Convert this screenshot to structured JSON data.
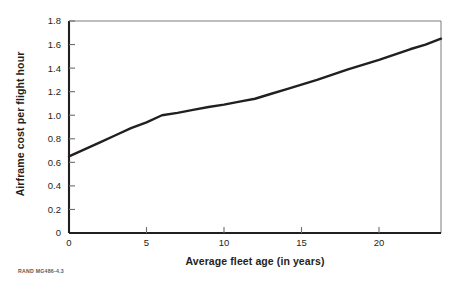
{
  "figure": {
    "source_note": "RAND MG486-4.3",
    "frame_color": "#6d6e71",
    "axis_color": "#231f20",
    "line_color": "#231f20",
    "background": "#ffffff"
  },
  "chart_data": {
    "type": "line",
    "title": "",
    "xlabel": "Average fleet age (in years)",
    "ylabel": "Airframe cost per flight hour",
    "xlim": [
      0,
      24
    ],
    "ylim": [
      0,
      1.8
    ],
    "xticks": [
      0,
      5,
      10,
      15,
      20
    ],
    "xtick_labels": [
      "0",
      "5",
      "10",
      "15",
      "20"
    ],
    "yticks": [
      0,
      0.2,
      0.4,
      0.6,
      0.8,
      1.0,
      1.2,
      1.4,
      1.6,
      1.8
    ],
    "ytick_labels": [
      "0",
      "0.2",
      "0.4",
      "0.6",
      "0.8",
      "1.0",
      "1.2",
      "1.4",
      "1.6",
      "1.8"
    ],
    "grid": false,
    "legend": null,
    "legend_position": "none",
    "series": [
      {
        "name": "Airframe cost per flight hour",
        "color": "#231f20",
        "x": [
          0,
          1,
          2,
          3,
          4,
          5,
          6,
          7,
          8,
          9,
          10,
          11,
          12,
          13,
          14,
          15,
          16,
          17,
          18,
          19,
          20,
          21,
          22,
          23,
          24
        ],
        "values": [
          0.65,
          0.71,
          0.77,
          0.83,
          0.89,
          0.94,
          1.0,
          1.02,
          1.045,
          1.07,
          1.09,
          1.115,
          1.14,
          1.18,
          1.22,
          1.26,
          1.3,
          1.345,
          1.39,
          1.43,
          1.47,
          1.515,
          1.56,
          1.6,
          1.65
        ]
      }
    ],
    "annotations": []
  }
}
